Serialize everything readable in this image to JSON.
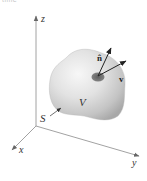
{
  "caption_fragment": "time",
  "axes": {
    "x_label": "x",
    "y_label": "y",
    "z_label": "z"
  },
  "labels": {
    "volume": "V",
    "surface": "S",
    "normal_vector": "n̂",
    "velocity_vector": "v"
  },
  "colors": {
    "axis": "#777777",
    "blob_light": "#f2f2f2",
    "blob_mid": "#d4d4d4",
    "blob_dark": "#a9a9a9",
    "patch": "#707070",
    "arrow": "#222222"
  }
}
